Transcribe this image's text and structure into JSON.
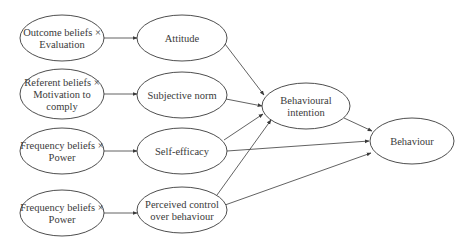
{
  "diagram": {
    "type": "path-model",
    "nodes": [
      {
        "id": "outcome_beliefs",
        "lines": [
          "Outcome beliefs ×",
          "Evaluation"
        ],
        "cx": 62,
        "cy": 38,
        "rx": 42,
        "ry": 23
      },
      {
        "id": "referent_beliefs",
        "lines": [
          "Referent beliefs ×",
          "Motivation to",
          "comply"
        ],
        "cx": 62,
        "cy": 94,
        "rx": 42,
        "ry": 25
      },
      {
        "id": "frequency_beliefs_1",
        "lines": [
          "Frequency beliefs ×",
          "Power"
        ],
        "cx": 62,
        "cy": 151,
        "rx": 42,
        "ry": 23
      },
      {
        "id": "frequency_beliefs_2",
        "lines": [
          "Frequency beliefs ×",
          "Power"
        ],
        "cx": 62,
        "cy": 213,
        "rx": 42,
        "ry": 23
      },
      {
        "id": "attitude",
        "lines": [
          "Attitude"
        ],
        "cx": 182,
        "cy": 38,
        "rx": 45,
        "ry": 23
      },
      {
        "id": "subjective_norm",
        "lines": [
          "Subjective norm"
        ],
        "cx": 182,
        "cy": 95,
        "rx": 45,
        "ry": 23
      },
      {
        "id": "self_efficacy",
        "lines": [
          "Self-efficacy"
        ],
        "cx": 182,
        "cy": 151,
        "rx": 45,
        "ry": 23
      },
      {
        "id": "perceived_control",
        "lines": [
          "Perceived control",
          "over behaviour"
        ],
        "cx": 182,
        "cy": 210,
        "rx": 45,
        "ry": 23
      },
      {
        "id": "behavioural_intention",
        "lines": [
          "Behavioural",
          "intention"
        ],
        "cx": 306,
        "cy": 106,
        "rx": 44,
        "ry": 23
      },
      {
        "id": "behaviour",
        "lines": [
          "Behaviour"
        ],
        "cx": 412,
        "cy": 141,
        "rx": 42,
        "ry": 23
      }
    ],
    "edges": [
      {
        "from": "outcome_beliefs",
        "to": "attitude",
        "x1": 104,
        "y1": 38,
        "x2": 137,
        "y2": 38
      },
      {
        "from": "referent_beliefs",
        "to": "subjective_norm",
        "x1": 104,
        "y1": 94,
        "x2": 137,
        "y2": 94
      },
      {
        "from": "frequency_beliefs_1",
        "to": "self_efficacy",
        "x1": 104,
        "y1": 151,
        "x2": 137,
        "y2": 151
      },
      {
        "from": "frequency_beliefs_2",
        "to": "perceived_control",
        "x1": 104,
        "y1": 213,
        "x2": 137,
        "y2": 213
      },
      {
        "from": "attitude",
        "to": "behavioural_intention",
        "x1": 225,
        "y1": 44,
        "x2": 264,
        "y2": 95
      },
      {
        "from": "subjective_norm",
        "to": "behavioural_intention",
        "x1": 226,
        "y1": 99,
        "x2": 262,
        "y2": 106
      },
      {
        "from": "self_efficacy",
        "to": "behavioural_intention",
        "x1": 224,
        "y1": 140,
        "x2": 263,
        "y2": 114
      },
      {
        "from": "perceived_control",
        "to": "behavioural_intention",
        "x1": 217,
        "y1": 195,
        "x2": 271,
        "y2": 120
      },
      {
        "from": "self_efficacy",
        "to": "behaviour",
        "x1": 227,
        "y1": 151,
        "x2": 369,
        "y2": 141
      },
      {
        "from": "perceived_control",
        "to": "behaviour",
        "x1": 225,
        "y1": 205,
        "x2": 371,
        "y2": 153
      },
      {
        "from": "behavioural_intention",
        "to": "behaviour",
        "x1": 344,
        "y1": 118,
        "x2": 372,
        "y2": 131
      }
    ],
    "colors": {
      "stroke": "#3a3a3a",
      "text": "#3a3a3a",
      "background": "#ffffff"
    }
  }
}
